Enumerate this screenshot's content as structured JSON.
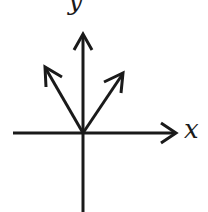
{
  "diagram": {
    "type": "vector-diagram",
    "stroke_color": "#1a1a1a",
    "axes": {
      "x": {
        "label": "x"
      },
      "y": {
        "label": "y"
      }
    },
    "vectors": [
      {
        "name": "vector-upper-left",
        "direction": "up-left"
      },
      {
        "name": "vector-upper-right",
        "direction": "up-right"
      },
      {
        "name": "vector-vertical",
        "direction": "up"
      }
    ]
  }
}
